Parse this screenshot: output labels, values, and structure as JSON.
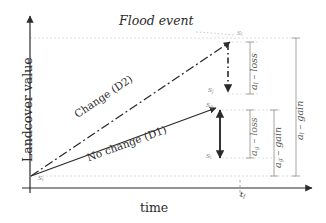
{
  "figure": {
    "type": "diagram",
    "title_annotation": "Flood event",
    "axes": {
      "y_label": "Landcover value",
      "x_label": "time",
      "x_tick_label": "t",
      "x_tick_sub": "f"
    },
    "series_labels": {
      "no_change": "No change (D1)",
      "change": "Change (D2)"
    },
    "states": [
      {
        "name": "s-initial",
        "base": "s",
        "sub": "i",
        "x": 30,
        "y": 176
      },
      {
        "name": "s-l-top",
        "base": "s",
        "sub": "l",
        "x": 236,
        "y": 33
      },
      {
        "name": "s-j-mid",
        "base": "s",
        "sub": "j",
        "x": 213,
        "y": 92
      },
      {
        "name": "s-g-upper",
        "base": "s",
        "sub": "g",
        "x": 212,
        "y": 108
      },
      {
        "name": "s-i-lower",
        "base": "s",
        "sub": "i",
        "x": 212,
        "y": 156
      }
    ],
    "brackets": [
      {
        "name": "a-l-loss",
        "base": "a",
        "sub": "l",
        "op": "loss"
      },
      {
        "name": "a-g-loss",
        "base": "a",
        "sub": "g",
        "op": "loss"
      },
      {
        "name": "a-g-gain",
        "base": "a",
        "sub": "g",
        "op": "gain"
      },
      {
        "name": "a-l-gain",
        "base": "a",
        "sub": "l",
        "op": "gain"
      }
    ],
    "colors": {
      "ink": "#2b2b2b",
      "faint": "#b9b9b9",
      "guide": "#cfcfcf"
    }
  }
}
